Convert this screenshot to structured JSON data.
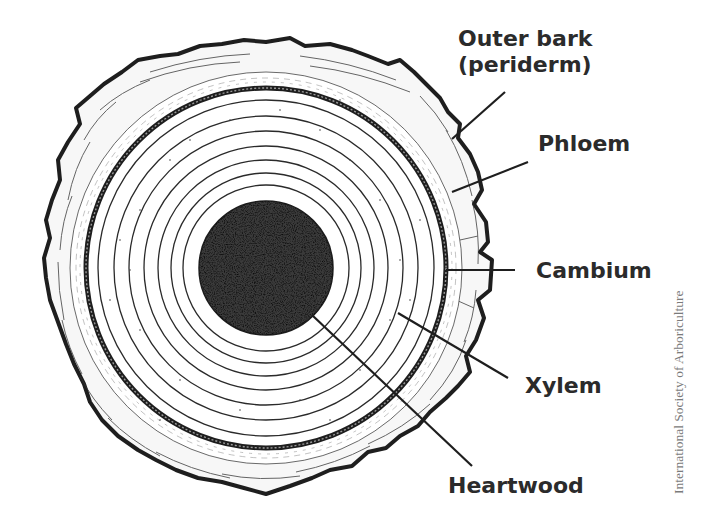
{
  "diagram": {
    "labels": {
      "outer_bark_line1": "Outer bark",
      "outer_bark_line2": "(periderm)",
      "phloem": "Phloem",
      "cambium": "Cambium",
      "xylem": "Xylem",
      "heartwood": "Heartwood"
    },
    "credit": "International Society of Arboriculture",
    "colors": {
      "ink": "#1e1e1e",
      "label_text": "#2b2b2b",
      "credit_text": "#7a7a7a",
      "background": "#ffffff",
      "heartwood_fill": "#3a3a3a"
    },
    "structure": {
      "center": [
        266,
        268
      ],
      "heartwood_radius": 67,
      "growth_ring_count": 8,
      "cambium_radius": 180,
      "bark_outer_radius_approx": 225
    }
  }
}
